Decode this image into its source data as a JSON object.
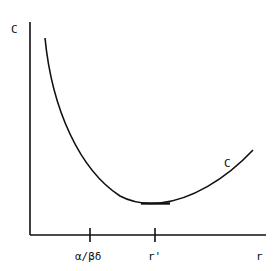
{
  "diagram": {
    "y_axis_label": "C",
    "x_axis_label": "r",
    "curve_label": "C",
    "ticks": [
      {
        "label": "α/βδ"
      },
      {
        "label": "r'"
      }
    ]
  },
  "colors": {
    "stroke": "#111111",
    "background": "#ffffff"
  }
}
